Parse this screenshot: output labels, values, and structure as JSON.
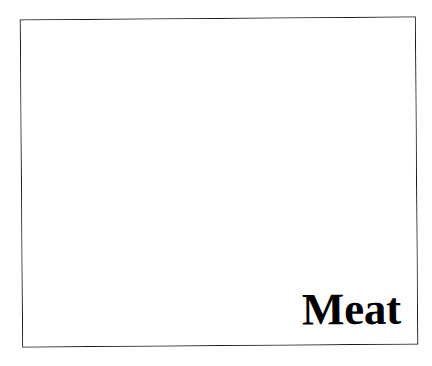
{
  "canvas": {
    "width": 432,
    "height": 366,
    "background_color": "#ffffff"
  },
  "card": {
    "border_color": "#1a1a1a",
    "fill_color": "#ffffff",
    "caption": "Meat",
    "caption_color": "#000000",
    "caption_alignment": "bottom-right"
  }
}
